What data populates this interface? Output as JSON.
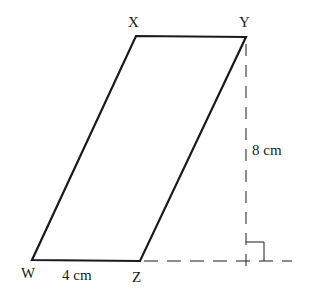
{
  "diagram": {
    "vertices": {
      "X": {
        "label": "X",
        "x": 136,
        "y": 36
      },
      "Y": {
        "label": "Y",
        "x": 246,
        "y": 37
      },
      "Z": {
        "label": "Z",
        "x": 140,
        "y": 261
      },
      "W": {
        "label": "W",
        "x": 32,
        "y": 260
      }
    },
    "measurements": {
      "base": "4 cm",
      "height": "8 cm"
    },
    "annotations": {
      "right_angle": "right-angle marker at foot of height",
      "height_line": "dashed perpendicular from Y",
      "base_extension": "dashed extension of WZ"
    },
    "colors": {
      "stroke": "#1a1a1a",
      "background": "#ffffff"
    }
  }
}
